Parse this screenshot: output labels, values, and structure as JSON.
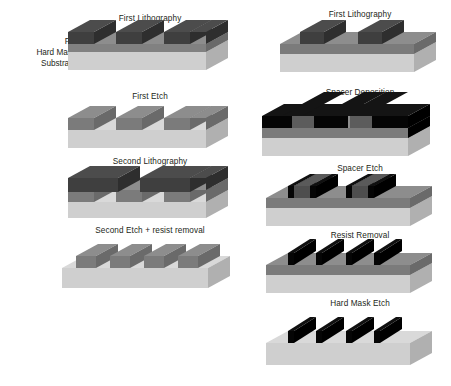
{
  "diagram": {
    "title_visible": false,
    "colors": {
      "substrate_top": "#d9d9d9",
      "substrate_front": "#c6c6c6",
      "substrate_side": "#b0b0b0",
      "hardmask_top": "#8d8d8d",
      "hardmask_front": "#7b7b7b",
      "hardmask_side": "#6a6a6a",
      "resist_top": "#4c4c4c",
      "resist_front": "#3f3f3f",
      "resist_side": "#2e2e2e",
      "spacer_top": "#101010",
      "spacer_front": "#050505",
      "spacer_side": "#000000",
      "text": "#231f20",
      "background": "#ffffff"
    },
    "stack_labels": [
      {
        "id": "pr",
        "text": "PR"
      },
      {
        "id": "hard-mask",
        "text": "Hard Mask"
      },
      {
        "id": "substrate",
        "text": "Substrate"
      }
    ],
    "left_column": {
      "name": "litho-etch-litho-etch",
      "steps": [
        {
          "id": "left-step-1",
          "caption": "First Lithography",
          "lines": 3
        },
        {
          "id": "left-step-2",
          "caption": "First Etch",
          "lines": 3
        },
        {
          "id": "left-step-3",
          "caption": "Second Lithography",
          "lines": 2
        },
        {
          "id": "left-step-4",
          "caption": "Second Etch + resist removal",
          "lines": 4
        }
      ]
    },
    "right_column": {
      "name": "self-aligned-double-patterning",
      "steps": [
        {
          "id": "right-step-1",
          "caption": "First Lithography",
          "lines": 2
        },
        {
          "id": "right-step-2",
          "caption": "Spacer Deposition",
          "lines": 2
        },
        {
          "id": "right-step-3",
          "caption": "Spacer Etch",
          "lines": 2
        },
        {
          "id": "right-step-4",
          "caption": "Resist Removal",
          "lines": 4
        },
        {
          "id": "right-step-5",
          "caption": "Hard Mask Etch",
          "lines": 4
        }
      ]
    }
  }
}
